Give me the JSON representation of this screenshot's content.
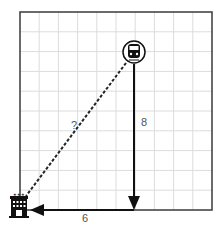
{
  "diagram": {
    "grid": {
      "columns": 10,
      "rows": 10,
      "line_color": "#d9d9d9",
      "border_color": "#333333"
    },
    "start": {
      "icon": "train-icon",
      "label": "train station"
    },
    "end": {
      "icon": "hotel-icon",
      "sign_text": "HOTEL"
    },
    "segments": {
      "vertical": {
        "label": "8",
        "direction": "down"
      },
      "horizontal": {
        "label": "6",
        "direction": "left"
      },
      "hypotenuse": {
        "label": "?",
        "style": "dashed"
      }
    }
  }
}
